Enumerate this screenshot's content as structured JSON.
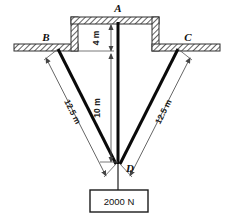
{
  "figure": {
    "type": "statics-free-body-diagram"
  },
  "points": {
    "a": "A",
    "b": "B",
    "c": "C",
    "d": "D"
  },
  "dimensions": {
    "recess_depth": "4 m",
    "vertical_length": "10 m",
    "cable_left": "12.5 m",
    "cable_right": "12.5 m"
  },
  "load": {
    "value": "2000 N"
  },
  "colors": {
    "member": "#0a0a0a",
    "hatch": "#4a4a4a",
    "dimension": "#555555",
    "background": "#ffffff"
  }
}
